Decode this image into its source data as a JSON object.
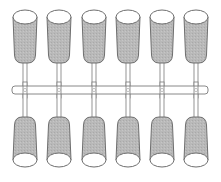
{
  "diagram": {
    "title": "",
    "colors": {
      "background": "#ffffff",
      "tube_fill": "#b9b9b9",
      "tube_outline": "#6e6e6e",
      "opening_fill": "#ffffff",
      "rail_fill": "#ffffff",
      "rail_outline": "#7a7a7a"
    },
    "rail": {
      "x": 12,
      "y": 86,
      "width": 196,
      "height": 8
    },
    "columns_x": [
      25,
      59,
      94,
      128,
      162,
      196
    ],
    "top_row": {
      "count": 6,
      "opening": "top",
      "tube_top_y": 10,
      "tube_bottom_y": 63,
      "tube_width": 24
    },
    "bottom_row": {
      "count": 6,
      "opening": "bottom",
      "tube_top_y": 117,
      "tube_bottom_y": 167,
      "tube_width": 24
    }
  }
}
